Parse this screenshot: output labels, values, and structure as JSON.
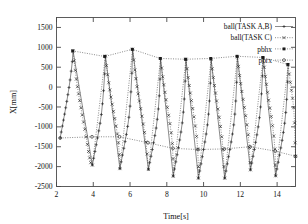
{
  "chart_data": {
    "type": "line",
    "title": "",
    "xlabel": "Time[s]",
    "ylabel": "X[mm]",
    "xlim": [
      2,
      15
    ],
    "ylim": [
      -2500,
      1750
    ],
    "xticks": [
      2,
      4,
      6,
      8,
      10,
      12,
      14
    ],
    "xtick_labels": [
      "2",
      "4",
      "6",
      "8",
      "10",
      "12",
      "14"
    ],
    "yticks": [
      1500,
      1000,
      500,
      0,
      -500,
      -1000,
      -1500,
      -2000,
      -2500
    ],
    "ytick_labels": [
      "1500",
      "1000",
      "500",
      "0",
      "-500",
      "-1000",
      "-1500",
      "-2000",
      "-2500"
    ],
    "grid": false,
    "legend_position": "top-right",
    "legend": [
      {
        "name": "ball(TASK A,B)",
        "style": "solid-line",
        "marker": "plus"
      },
      {
        "name": "ball(TASK C)",
        "style": "dotted-line",
        "marker": "cross"
      },
      {
        "name": "pbhx",
        "style": "dotted-line",
        "marker": "filled-square"
      },
      {
        "name": "pbrx",
        "style": "dotted-line",
        "marker": "open-circle"
      }
    ],
    "series": [
      {
        "name": "ball(TASK A,B)",
        "marker": "plus",
        "style": "solid-line",
        "comment": "rising ramps of the sawtooth: ball carried up by the arm",
        "points": [
          [
            2.2,
            -1280
          ],
          [
            2.26,
            -1130
          ],
          [
            2.32,
            -980
          ],
          [
            2.38,
            -830
          ],
          [
            2.44,
            -680
          ],
          [
            2.5,
            -520
          ],
          [
            2.56,
            -360
          ],
          [
            2.62,
            -190
          ],
          [
            2.68,
            -10
          ],
          [
            2.74,
            180
          ],
          [
            2.8,
            400
          ],
          [
            2.86,
            640
          ],
          [
            2.9,
            910
          ],
          [
            3.95,
            -1960
          ],
          [
            4.02,
            -1790
          ],
          [
            4.09,
            -1620
          ],
          [
            4.16,
            -1450
          ],
          [
            4.23,
            -1280
          ],
          [
            4.3,
            -1100
          ],
          [
            4.37,
            -910
          ],
          [
            4.44,
            -690
          ],
          [
            4.5,
            -420
          ],
          [
            4.56,
            -90
          ],
          [
            4.62,
            330
          ],
          [
            4.66,
            780
          ],
          [
            5.45,
            -2050
          ],
          [
            5.52,
            -1880
          ],
          [
            5.59,
            -1710
          ],
          [
            5.66,
            -1540
          ],
          [
            5.73,
            -1370
          ],
          [
            5.8,
            -1190
          ],
          [
            5.87,
            -990
          ],
          [
            5.94,
            -760
          ],
          [
            6.0,
            -480
          ],
          [
            6.05,
            -120
          ],
          [
            6.1,
            350
          ],
          [
            6.14,
            950
          ],
          [
            7.0,
            -2070
          ],
          [
            7.07,
            -1900
          ],
          [
            7.14,
            -1740
          ],
          [
            7.21,
            -1570
          ],
          [
            7.28,
            -1400
          ],
          [
            7.35,
            -1220
          ],
          [
            7.42,
            -1030
          ],
          [
            7.48,
            -810
          ],
          [
            7.54,
            -550
          ],
          [
            7.59,
            -220
          ],
          [
            7.63,
            200
          ],
          [
            7.66,
            720
          ],
          [
            8.35,
            -2240
          ],
          [
            8.42,
            -2060
          ],
          [
            8.49,
            -1880
          ],
          [
            8.56,
            -1700
          ],
          [
            8.63,
            -1520
          ],
          [
            8.7,
            -1330
          ],
          [
            8.77,
            -1130
          ],
          [
            8.84,
            -900
          ],
          [
            8.9,
            -630
          ],
          [
            8.95,
            -300
          ],
          [
            9.0,
            150
          ],
          [
            9.04,
            700
          ],
          [
            9.72,
            -2290
          ],
          [
            9.79,
            -2110
          ],
          [
            9.86,
            -1930
          ],
          [
            9.93,
            -1750
          ],
          [
            10.0,
            -1570
          ],
          [
            10.07,
            -1380
          ],
          [
            10.14,
            -1180
          ],
          [
            10.21,
            -950
          ],
          [
            10.27,
            -680
          ],
          [
            10.32,
            -350
          ],
          [
            10.37,
            100
          ],
          [
            10.41,
            700
          ],
          [
            11.15,
            -2290
          ],
          [
            11.22,
            -2110
          ],
          [
            11.29,
            -1930
          ],
          [
            11.36,
            -1750
          ],
          [
            11.43,
            -1570
          ],
          [
            11.5,
            -1380
          ],
          [
            11.57,
            -1180
          ],
          [
            11.64,
            -950
          ],
          [
            11.7,
            -680
          ],
          [
            11.75,
            -350
          ],
          [
            11.8,
            120
          ],
          [
            11.84,
            760
          ],
          [
            12.55,
            -2080
          ],
          [
            12.62,
            -1910
          ],
          [
            12.69,
            -1740
          ],
          [
            12.76,
            -1570
          ],
          [
            12.83,
            -1390
          ],
          [
            12.9,
            -1200
          ],
          [
            12.97,
            -1000
          ],
          [
            13.04,
            -770
          ],
          [
            13.1,
            -500
          ],
          [
            13.15,
            -170
          ],
          [
            13.2,
            280
          ],
          [
            13.24,
            740
          ],
          [
            13.92,
            -2230
          ],
          [
            13.99,
            -2060
          ],
          [
            14.06,
            -1890
          ],
          [
            14.13,
            -1710
          ],
          [
            14.2,
            -1530
          ],
          [
            14.27,
            -1340
          ],
          [
            14.34,
            -1140
          ],
          [
            14.41,
            -910
          ],
          [
            14.47,
            -640
          ],
          [
            14.52,
            -310
          ],
          [
            14.57,
            130
          ],
          [
            14.6,
            560
          ]
        ]
      },
      {
        "name": "ball(TASK C)",
        "marker": "cross",
        "style": "dotted-line",
        "comment": "falling ramps of the sawtooth: ball released and returning",
        "points": [
          [
            2.9,
            910
          ],
          [
            2.96,
            660
          ],
          [
            3.02,
            420
          ],
          [
            3.08,
            200
          ],
          [
            3.14,
            10
          ],
          [
            3.2,
            -170
          ],
          [
            3.26,
            -340
          ],
          [
            3.33,
            -520
          ],
          [
            3.4,
            -700
          ],
          [
            3.47,
            -880
          ],
          [
            3.54,
            -1060
          ],
          [
            3.61,
            -1250
          ],
          [
            3.68,
            -1440
          ],
          [
            3.74,
            -1620
          ],
          [
            3.8,
            -1780
          ],
          [
            3.86,
            -1900
          ],
          [
            3.95,
            -1960
          ],
          [
            4.66,
            780
          ],
          [
            4.72,
            540
          ],
          [
            4.78,
            310
          ],
          [
            4.84,
            110
          ],
          [
            4.9,
            -70
          ],
          [
            4.96,
            -250
          ],
          [
            5.03,
            -430
          ],
          [
            5.1,
            -610
          ],
          [
            5.17,
            -790
          ],
          [
            5.24,
            -980
          ],
          [
            5.31,
            -1180
          ],
          [
            5.37,
            -1400
          ],
          [
            5.42,
            -1700
          ],
          [
            5.45,
            -2050
          ],
          [
            6.14,
            950
          ],
          [
            6.2,
            680
          ],
          [
            6.26,
            430
          ],
          [
            6.32,
            210
          ],
          [
            6.38,
            10
          ],
          [
            6.44,
            -170
          ],
          [
            6.51,
            -350
          ],
          [
            6.58,
            -540
          ],
          [
            6.65,
            -730
          ],
          [
            6.72,
            -930
          ],
          [
            6.79,
            -1140
          ],
          [
            6.86,
            -1380
          ],
          [
            6.93,
            -1680
          ],
          [
            7.0,
            -2070
          ],
          [
            7.66,
            720
          ],
          [
            7.72,
            480
          ],
          [
            7.78,
            260
          ],
          [
            7.84,
            60
          ],
          [
            7.9,
            -130
          ],
          [
            7.96,
            -320
          ],
          [
            8.03,
            -510
          ],
          [
            8.1,
            -710
          ],
          [
            8.17,
            -920
          ],
          [
            8.24,
            -1150
          ],
          [
            8.3,
            -1420
          ],
          [
            8.34,
            -1800
          ],
          [
            8.35,
            -2240
          ],
          [
            9.04,
            700
          ],
          [
            9.1,
            460
          ],
          [
            9.16,
            240
          ],
          [
            9.22,
            40
          ],
          [
            9.28,
            -150
          ],
          [
            9.34,
            -340
          ],
          [
            9.41,
            -540
          ],
          [
            9.48,
            -750
          ],
          [
            9.55,
            -980
          ],
          [
            9.62,
            -1240
          ],
          [
            9.68,
            -1560
          ],
          [
            9.72,
            -2000
          ],
          [
            9.72,
            -2290
          ],
          [
            10.41,
            700
          ],
          [
            10.47,
            460
          ],
          [
            10.53,
            240
          ],
          [
            10.59,
            40
          ],
          [
            10.65,
            -150
          ],
          [
            10.71,
            -350
          ],
          [
            10.78,
            -550
          ],
          [
            10.85,
            -760
          ],
          [
            10.92,
            -990
          ],
          [
            10.99,
            -1250
          ],
          [
            11.06,
            -1570
          ],
          [
            11.11,
            -2000
          ],
          [
            11.15,
            -2290
          ],
          [
            11.84,
            760
          ],
          [
            11.9,
            520
          ],
          [
            11.96,
            290
          ],
          [
            12.02,
            90
          ],
          [
            12.08,
            -110
          ],
          [
            12.15,
            -310
          ],
          [
            12.22,
            -510
          ],
          [
            12.29,
            -720
          ],
          [
            12.36,
            -950
          ],
          [
            12.43,
            -1200
          ],
          [
            12.49,
            -1520
          ],
          [
            12.53,
            -1900
          ],
          [
            12.55,
            -2080
          ],
          [
            13.24,
            740
          ],
          [
            13.3,
            500
          ],
          [
            13.36,
            270
          ],
          [
            13.42,
            70
          ],
          [
            13.48,
            -130
          ],
          [
            13.54,
            -330
          ],
          [
            13.61,
            -530
          ],
          [
            13.68,
            -740
          ],
          [
            13.75,
            -970
          ],
          [
            13.82,
            -1230
          ],
          [
            13.88,
            -1560
          ],
          [
            13.91,
            -1960
          ],
          [
            13.92,
            -2230
          ],
          [
            14.6,
            560
          ],
          [
            14.66,
            330
          ],
          [
            14.72,
            120
          ],
          [
            14.78,
            -80
          ],
          [
            14.84,
            -280
          ],
          [
            14.9,
            -520
          ],
          [
            14.95,
            -900
          ],
          [
            14.98,
            -1400
          ],
          [
            15.0,
            -1740
          ]
        ]
      },
      {
        "name": "pbhx",
        "marker": "filled-square",
        "style": "dotted-line",
        "comment": "upper envelope: hand/holding position at each catch",
        "points": [
          [
            2.88,
            910
          ],
          [
            4.62,
            770
          ],
          [
            6.12,
            950
          ],
          [
            7.64,
            720
          ],
          [
            9.02,
            700
          ],
          [
            10.39,
            720
          ],
          [
            11.82,
            775
          ],
          [
            13.22,
            745
          ],
          [
            14.58,
            570
          ]
        ]
      },
      {
        "name": "pbrx",
        "marker": "open-circle",
        "style": "dotted-line",
        "comment": "lower envelope: release position at each bottom of the sawtooth",
        "points": [
          [
            2.2,
            -1280
          ],
          [
            3.93,
            -1250
          ],
          [
            5.43,
            -1250
          ],
          [
            6.98,
            -1400
          ],
          [
            8.33,
            -1540
          ],
          [
            9.7,
            -1570
          ],
          [
            11.13,
            -1555
          ],
          [
            12.53,
            -1500
          ],
          [
            13.9,
            -1610
          ],
          [
            15.0,
            -1740
          ]
        ]
      }
    ]
  },
  "axis": {
    "ylabel": "X[mm]",
    "xlabel": "Time[s]"
  }
}
